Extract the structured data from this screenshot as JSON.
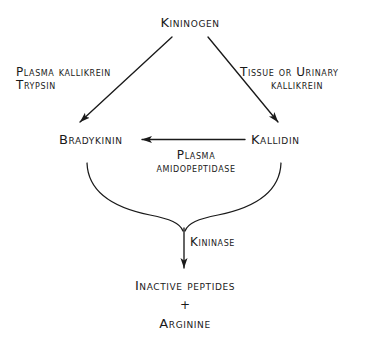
{
  "diagram": {
    "background_color": "#ffffff",
    "ink_color": "#1a1a1a",
    "nodes": {
      "kininogen": "Kininogen",
      "bradykinin": "Bradykinin",
      "kallidin": "Kallidin",
      "inactive_peptides": "Inactive peptides",
      "plus": "+",
      "arginine": "Arginine"
    },
    "enzymes": {
      "plasma_kallikrein": "Plasma kallikrein",
      "trypsin": "Trypsin",
      "tissue_or_urinary": "Tissue or Urinary",
      "kallikrein": "kallikrein",
      "plasma": "Plasma",
      "amidopeptidase": "amidopeptidase",
      "kininase": "Kininase"
    },
    "arrows": {
      "left_branch": "kininogen-to-bradykinin-arrow",
      "right_branch": "kininogen-to-kallidin-arrow",
      "kallidin_to_bradykinin": "kallidin-to-bradykinin-arrow",
      "kininase_arrow": "kininase-to-products-arrow"
    }
  }
}
